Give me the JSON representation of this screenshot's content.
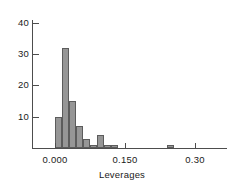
{
  "chart_data": {
    "type": "bar",
    "title": "",
    "subtitle": "",
    "xlabel": "Leverages",
    "ylabel": "",
    "grid": false,
    "legend": false,
    "legend_position": "none",
    "xlim": [
      -0.012,
      0.312
    ],
    "ylim": [
      0,
      43
    ],
    "bin_width": 0.015,
    "x_tick_labels": [
      "0.000",
      "0.150",
      "0.30"
    ],
    "x_tick_values": [
      0.0,
      0.15,
      0.3
    ],
    "y_tick_labels": [
      "10",
      "20",
      "30",
      "40"
    ],
    "y_tick_values": [
      10,
      20,
      30,
      40
    ],
    "bin_starts": [
      0.0,
      0.015,
      0.03,
      0.045,
      0.06,
      0.075,
      0.09,
      0.105,
      0.12,
      0.24
    ],
    "bin_centers": [
      0.0075,
      0.0225,
      0.0375,
      0.0525,
      0.0675,
      0.0825,
      0.0975,
      0.1125,
      0.1275,
      0.2475
    ],
    "categories": [
      "0.000-0.015",
      "0.015-0.030",
      "0.030-0.045",
      "0.045-0.060",
      "0.060-0.075",
      "0.075-0.090",
      "0.090-0.105",
      "0.105-0.120",
      "0.120-0.135",
      "0.240-0.255"
    ],
    "values": [
      10,
      32,
      15,
      7,
      3,
      1,
      4,
      1,
      1,
      1
    ],
    "bar_fill_color": "#969696",
    "bar_edge_color": "#5c5c5c",
    "axis_color": "#4d4d4d",
    "text_color": "#1a1a1a",
    "background_color": "#ffffff"
  },
  "axes": {
    "x_title": "Leverages",
    "y_ticks": [
      {
        "label": "40",
        "value": 40
      },
      {
        "label": "30",
        "value": 30
      },
      {
        "label": "20",
        "value": 20
      },
      {
        "label": "10",
        "value": 10
      }
    ],
    "x_ticks": [
      {
        "label": "0.000",
        "value": 0.0
      },
      {
        "label": "0.150",
        "value": 0.15
      },
      {
        "label": "0.30",
        "value": 0.3
      }
    ]
  }
}
